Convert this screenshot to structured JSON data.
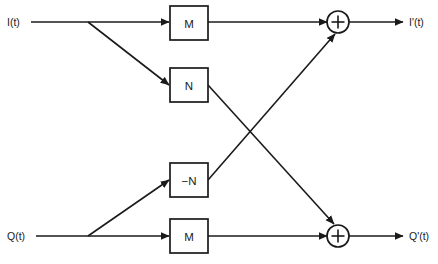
{
  "diagram": {
    "colors": {
      "line": "#1a1a1a",
      "background": "#ffffff",
      "block_fill": "#ffffff"
    },
    "inputs": [
      {
        "id": "i-in",
        "label": "I(t)",
        "x": 8,
        "y": 22
      },
      {
        "id": "q-in",
        "label": "Q(t)",
        "x": 8,
        "y": 236
      }
    ],
    "outputs": [
      {
        "id": "i-out",
        "label": "I'(t)",
        "x": 408,
        "y": 22
      },
      {
        "id": "q-out",
        "label": "Q'(t)",
        "x": 408,
        "y": 236
      }
    ],
    "blocks": [
      {
        "id": "gain-m-top",
        "label": "M",
        "x": 170,
        "y": 6,
        "w": 38,
        "h": 34
      },
      {
        "id": "gain-n",
        "label": "N",
        "x": 170,
        "y": 68,
        "w": 38,
        "h": 34
      },
      {
        "id": "gain-neg-n",
        "label": "−N",
        "x": 170,
        "y": 163,
        "w": 38,
        "h": 34
      },
      {
        "id": "gain-m-bottom",
        "label": "M",
        "x": 170,
        "y": 219,
        "w": 38,
        "h": 34
      }
    ],
    "adders": [
      {
        "id": "adder-i",
        "symbol": "+",
        "cx": 338,
        "cy": 22,
        "r": 11
      },
      {
        "id": "adder-q",
        "symbol": "+",
        "cx": 338,
        "cy": 236,
        "r": 11
      }
    ],
    "junctions": [
      {
        "id": "junction-i",
        "x": 88,
        "y": 22
      },
      {
        "id": "junction-q",
        "x": 88,
        "y": 236
      }
    ],
    "connections": [
      {
        "id": "wire-i-to-m-top",
        "from": "I(t)",
        "to": "M (top)"
      },
      {
        "id": "wire-i-to-n",
        "from": "I(t)",
        "to": "N"
      },
      {
        "id": "wire-m-top-to-adder-i",
        "from": "M (top)",
        "to": "adder I'(t)"
      },
      {
        "id": "wire-n-to-adder-q",
        "from": "N",
        "to": "adder Q'(t)"
      },
      {
        "id": "wire-q-to-neg-n",
        "from": "Q(t)",
        "to": "−N"
      },
      {
        "id": "wire-q-to-m-bottom",
        "from": "Q(t)",
        "to": "M (bottom)"
      },
      {
        "id": "wire-neg-n-to-adder-i",
        "from": "−N",
        "to": "adder I'(t)"
      },
      {
        "id": "wire-m-bottom-to-adder-q",
        "from": "M (bottom)",
        "to": "adder Q'(t)"
      },
      {
        "id": "wire-adder-i-to-out",
        "from": "adder I'(t)",
        "to": "I'(t)"
      },
      {
        "id": "wire-adder-q-to-out",
        "from": "adder Q'(t)",
        "to": "Q'(t)"
      }
    ]
  }
}
